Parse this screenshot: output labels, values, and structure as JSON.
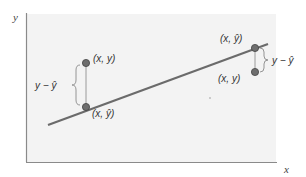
{
  "diagram": {
    "axes": {
      "x_label": "x",
      "y_label": "y"
    },
    "colors": {
      "plot_background": "#f3f3f3",
      "axis": "#8a8a8a",
      "regression_line": "#6b6b6b",
      "point_fill": "#6e6e6e",
      "point_stroke": "#444444",
      "connector": "#9a9a9a",
      "brace": "#8a8a8a"
    },
    "left_pair": {
      "observed_label": "(x, y)",
      "predicted_label": "(x, ŷ)",
      "residual_label": "y − ŷ"
    },
    "right_pair": {
      "observed_label": "(x, y)",
      "predicted_label": "(x, ŷ)",
      "residual_label": "y − ŷ"
    }
  }
}
